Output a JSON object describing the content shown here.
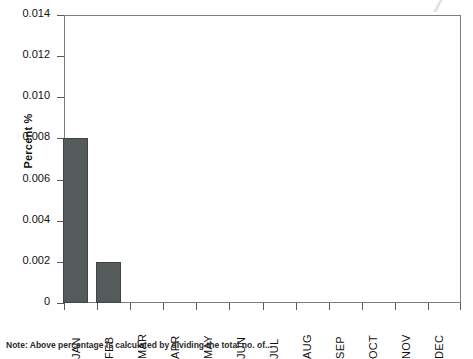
{
  "chart_data": {
    "type": "bar",
    "title": "",
    "xlabel": "",
    "ylabel": "Percent %",
    "categories": [
      "JAN",
      "FEB",
      "MAR",
      "APR",
      "MAY",
      "JUN",
      "JUL",
      "AUG",
      "SEP",
      "OCT",
      "NOV",
      "DEC"
    ],
    "values": [
      0.008,
      0.002,
      0,
      0,
      0,
      0,
      0,
      0,
      0,
      0,
      0,
      0
    ],
    "ylim": [
      0,
      0.014
    ],
    "yticks": [
      0,
      0.002,
      0.004,
      0.006,
      0.008,
      0.01,
      0.012,
      0.014
    ],
    "ytick_labels": [
      "0",
      "0.002",
      "0.004",
      "0.006",
      "0.008",
      "0.010",
      "0.012",
      "0.014"
    ],
    "grid": false,
    "legend": null,
    "bar_color": "#555a5a",
    "frame_color": "#7d7d7d",
    "background": "#ffffff"
  },
  "note": {
    "text": "Note: Above percentage is calculated by dividing the total no. of..."
  }
}
